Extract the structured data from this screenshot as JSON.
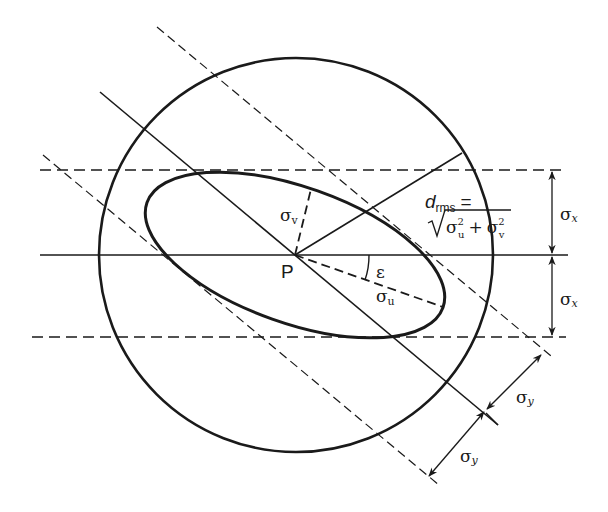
{
  "diagram": {
    "colors": {
      "stroke": "#1a1a1a",
      "background": "#ffffff"
    },
    "labels": {
      "point": "P",
      "sigma_v": "σ",
      "sigma_v_sub": "v",
      "sigma_u": "σ",
      "sigma_u_sub": "u",
      "epsilon": "ε",
      "drms_d": "d",
      "drms_sub": "rms",
      "drms_eq": "=",
      "drms_formula_sigma1": "σ",
      "drms_formula_sup1": "2",
      "drms_formula_sub1": "u",
      "drms_formula_plus": "+",
      "drms_formula_sigma2": "σ",
      "drms_formula_sup2": "2",
      "drms_formula_sub2": "v",
      "sigma_x_upper": "σ",
      "sigma_x_upper_sub": "x",
      "sigma_x_lower": "σ",
      "sigma_x_lower_sub": "x",
      "sigma_y_upper": "σ",
      "sigma_y_upper_sub": "y",
      "sigma_y_lower": "σ",
      "sigma_y_lower_sub": "y"
    },
    "elements": [
      "circle (radius = d_rms)",
      "error ellipse centered at P rotated by ε",
      "horizontal axis through P",
      "dashed horizontal tangents at ±σx",
      "diagonal axis through P",
      "dashed diagonal tangents at ±σy",
      "σu semi-major axis (dashed)",
      "σv semi-minor axis (dashed)",
      "d_rms radius line"
    ]
  }
}
